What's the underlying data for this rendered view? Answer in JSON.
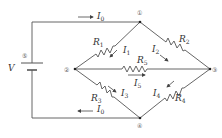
{
  "diagram": {
    "type": "wheatstone-bridge-circuit",
    "source": {
      "label": "V",
      "node": "⑤"
    },
    "nodes": [
      "①",
      "②",
      "③",
      "④",
      "⑤"
    ],
    "resistors": [
      {
        "name": "R1",
        "base": "R",
        "sub": "1",
        "from": "②",
        "to": "①"
      },
      {
        "name": "R2",
        "base": "R",
        "sub": "2",
        "from": "①",
        "to": "③"
      },
      {
        "name": "R3",
        "base": "R",
        "sub": "3",
        "from": "②",
        "to": "④"
      },
      {
        "name": "R4",
        "base": "R",
        "sub": "4",
        "from": "④",
        "to": "③"
      },
      {
        "name": "R5",
        "base": "R",
        "sub": "5",
        "from": "②",
        "to": "③"
      }
    ],
    "currents": [
      {
        "name": "I0_top",
        "base": "I",
        "sub": "0",
        "direction": "right"
      },
      {
        "name": "I0_bottom",
        "base": "I",
        "sub": "0",
        "direction": "left"
      },
      {
        "name": "I1",
        "base": "I",
        "sub": "1"
      },
      {
        "name": "I2",
        "base": "I",
        "sub": "2"
      },
      {
        "name": "I3",
        "base": "I",
        "sub": "3"
      },
      {
        "name": "I4",
        "base": "I",
        "sub": "4"
      },
      {
        "name": "I5",
        "base": "I",
        "sub": "5",
        "direction": "right"
      }
    ]
  }
}
